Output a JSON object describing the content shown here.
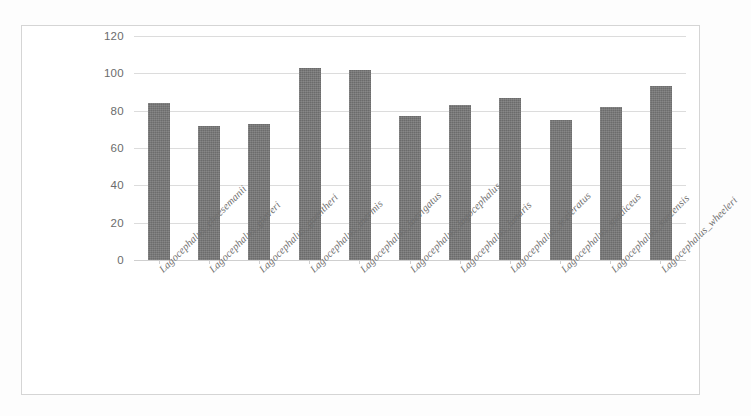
{
  "chart_data": {
    "type": "bar",
    "title": "",
    "xlabel": "",
    "ylabel": "",
    "ylim": [
      0,
      120
    ],
    "yticks": [
      0,
      20,
      40,
      60,
      80,
      100,
      120
    ],
    "ytick_labels": [
      "0",
      "20",
      "40",
      "60",
      "80",
      "100",
      "120"
    ],
    "grid": true,
    "legend": "none",
    "bar_color": "#767676",
    "categories": [
      "Lagocephalus_cheesemanii",
      "Lagocephalus_gloveri",
      "Lagocephalus_guentheri",
      "Lagocephalus_inermis",
      "Lagocephalus_laevigatus",
      "Lagocephalus_lagocephalus",
      "Lagocephalus_lunaris",
      "Lagocephalus_sceleratus",
      "Lagocephalus_spadiceus",
      "Lagocephalus_suezensis",
      "Lagocephalus_wheeleri"
    ],
    "values": [
      84,
      72,
      73,
      103,
      102,
      77,
      83,
      87,
      75,
      82,
      93
    ]
  }
}
